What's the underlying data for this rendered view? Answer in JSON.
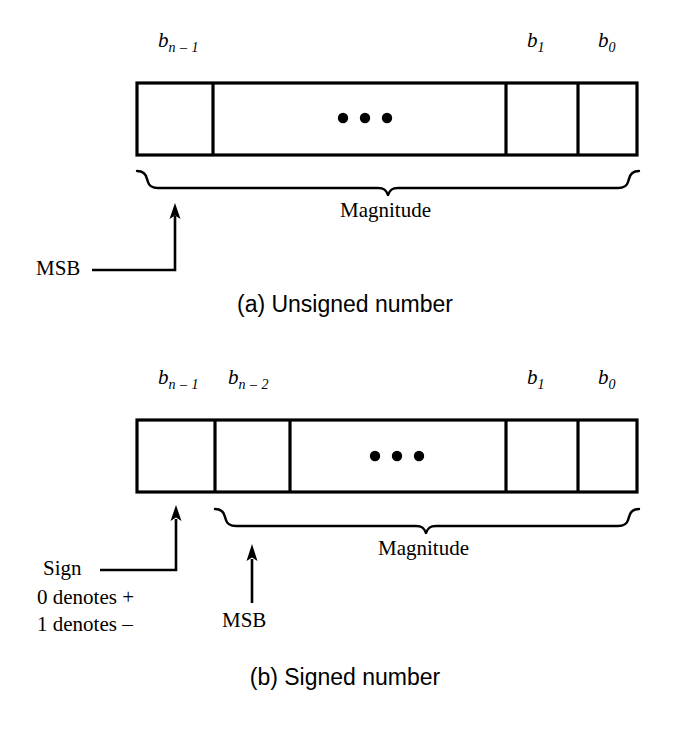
{
  "figure": {
    "ink_color": "#000000",
    "background": "#ffffff"
  },
  "diagrams": [
    {
      "id": "unsigned",
      "caption": "(a) Unsigned number",
      "bit_labels": [
        {
          "base": "b",
          "sub": "n – 1"
        },
        {
          "base": "b",
          "sub": "1"
        },
        {
          "base": "b",
          "sub": "0"
        }
      ],
      "ellipsis": "• • •",
      "brace_label": "Magnitude",
      "pointer_label": "MSB",
      "cells": 4
    },
    {
      "id": "signed",
      "caption": "(b) Signed number",
      "bit_labels": [
        {
          "base": "b",
          "sub": "n – 1"
        },
        {
          "base": "b",
          "sub": "n – 2"
        },
        {
          "base": "b",
          "sub": "1"
        },
        {
          "base": "b",
          "sub": "0"
        }
      ],
      "ellipsis": "• • •",
      "brace_label": "Magnitude",
      "sign_label": "Sign",
      "sign_note_positive": "0 denotes +",
      "sign_note_negative": "1 denotes –",
      "pointer_label": "MSB",
      "cells": 5
    }
  ]
}
